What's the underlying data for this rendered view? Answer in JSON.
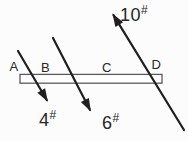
{
  "colors": {
    "background": "#fcfcfc",
    "force_line": "#1f1f1f",
    "beam_outline": "#5a5a5a",
    "label_text": "#262626"
  },
  "beam": {
    "points": [
      {
        "label": "A"
      },
      {
        "label": "B"
      },
      {
        "label": "C"
      },
      {
        "label": "D"
      }
    ]
  },
  "forces": [
    {
      "value": "4",
      "unit": "#",
      "direction": "down-right"
    },
    {
      "value": "6",
      "unit": "#",
      "direction": "down-right"
    },
    {
      "value": "10",
      "unit": "#",
      "direction": "up-left"
    }
  ]
}
